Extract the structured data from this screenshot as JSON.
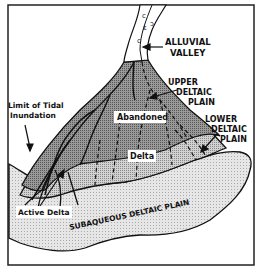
{
  "diagram": {
    "type": "delta-environments-map",
    "labels": {
      "alluvial_valley_line1": "ALLUVIAL",
      "alluvial_valley_line2": "VALLEY",
      "upper_deltaic_line1": "UPPER",
      "upper_deltaic_line2": "DELTAIC",
      "upper_deltaic_line3": "PLAIN",
      "lower_deltaic_line1": "LOWER",
      "lower_deltaic_line2": "DELTAIC",
      "lower_deltaic_line3": "PLAIN",
      "tidal_line1": "Limit of Tidal",
      "tidal_line2": "Inundation",
      "abandoned": "Abandoned",
      "delta": "Delta",
      "active_delta": "Active Delta",
      "subaqueous": "SUBAQUEOUS DELTAIC PLAIN"
    },
    "colors": {
      "border": "#222222",
      "upper_plain_fill": "#8a8a8a",
      "lower_plain_fill": "#c4c4c4",
      "subaqueous_fill": "#dedede",
      "channel": "#111111",
      "background": "#ffffff"
    }
  }
}
